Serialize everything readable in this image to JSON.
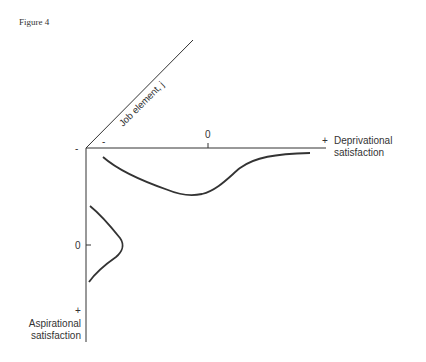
{
  "figure": {
    "title": "Figure 4"
  },
  "axes": {
    "diagonal_label": "Job element, j",
    "horizontal": {
      "minus_label": "-",
      "zero_label": "0",
      "plus_label": "+",
      "name_line1": "Deprivational",
      "name_line2": "satisfaction"
    },
    "vertical": {
      "minus_label": "-",
      "zero_label": "0",
      "plus_label": "+",
      "name_line1": "Aspirational",
      "name_line2": "satisfaction"
    }
  },
  "colors": {
    "ink": "#333333",
    "background": "#ffffff"
  }
}
